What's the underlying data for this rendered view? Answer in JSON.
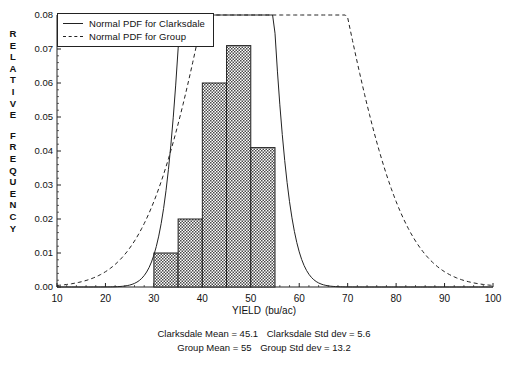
{
  "chart_data": {
    "type": "bar",
    "title": "",
    "subtitle": "",
    "xlabel": "YIELD",
    "xlabel_unit": "(bu/ac)",
    "ylabel": "RELATIVE FREQUENCY",
    "ylabel_line1": "RELATIVE",
    "ylabel_line2": "FREQUENCY",
    "xlim": [
      10,
      100
    ],
    "ylim": [
      0.0,
      0.08
    ],
    "xticks": [
      10,
      20,
      30,
      40,
      50,
      60,
      70,
      80,
      90,
      100
    ],
    "xtick_labels": [
      "10",
      "20",
      "30",
      "40",
      "50",
      "60",
      "70",
      "80",
      "90",
      "100"
    ],
    "yticks": [
      0.0,
      0.01,
      0.02,
      0.03,
      0.04,
      0.05,
      0.06,
      0.07,
      0.08
    ],
    "ytick_labels": [
      "0.00",
      "0.01",
      "0.02",
      "0.03",
      "0.04",
      "0.05",
      "0.06",
      "0.07",
      "0.08"
    ],
    "grid": false,
    "legend_position": "upper-left",
    "bin_width": 5,
    "bin_edges": [
      30,
      35,
      40,
      45,
      50,
      55
    ],
    "categories": [
      "30-35",
      "35-40",
      "40-45",
      "45-50",
      "50-55"
    ],
    "values": [
      0.01,
      0.02,
      0.06,
      0.071,
      0.041
    ],
    "bar_fill": "crosshatch",
    "bar_edge_color": "#222222",
    "series": [
      {
        "name": "Normal PDF for Clarksdale",
        "type": "line",
        "style": "solid",
        "color": "#222222",
        "mean": 45.1,
        "std_dev": 5.6,
        "scale": 5
      },
      {
        "name": "Normal PDF for Group",
        "type": "line",
        "style": "dashed",
        "color": "#222222",
        "mean": 55,
        "std_dev": 13.2,
        "scale": 5
      }
    ]
  },
  "legend": {
    "items": [
      {
        "label": "Normal PDF for Clarksdale",
        "style": "solid"
      },
      {
        "label": "Normal PDF for Group",
        "style": "dashed"
      }
    ]
  },
  "footer": {
    "line1": {
      "clarksdale_mean_label": "Clarksdale Mean  =  45.1",
      "clarksdale_std_label": "Clarksdale Std dev  =  5.6"
    },
    "line2": {
      "group_mean_label": "Group Mean  =  55",
      "group_std_label": "Group Std dev  =  13.2"
    }
  },
  "stats": {
    "clarksdale_mean": 45.1,
    "clarksdale_std_dev": 5.6,
    "group_mean": 55,
    "group_std_dev": 13.2
  }
}
